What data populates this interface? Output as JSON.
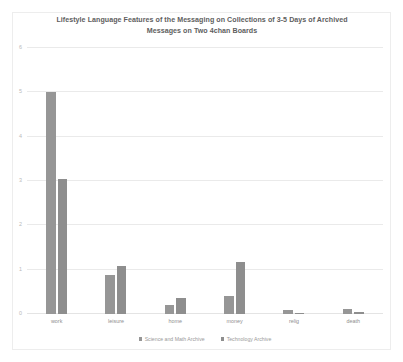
{
  "chart_data": {
    "type": "bar",
    "title": "Lifestyle Language Features of the Messaging on Collections of 3-5 Days of Archived Messages on Two 4chan Boards",
    "title_line_1": "Lifestyle Language Features of the Messaging on Collections of 3-5 Days of Archived",
    "title_line_2": "Messages on Two 4chan Boards",
    "xlabel": "",
    "ylabel": "",
    "categories": [
      "work",
      "leisure",
      "home",
      "money",
      "relig",
      "death"
    ],
    "series": [
      {
        "name": "Science and Math Archive",
        "color": "#969696",
        "values": [
          5.0,
          0.88,
          0.2,
          0.4,
          0.1,
          0.12
        ]
      },
      {
        "name": "Technology Archive",
        "color": "#8e8e8e",
        "values": [
          3.05,
          1.08,
          0.37,
          1.17,
          0.03,
          0.04
        ]
      }
    ],
    "ylim": [
      0,
      6
    ],
    "yticks": [
      0,
      1,
      2,
      3,
      4,
      5,
      6
    ],
    "ytick_labels": [
      "0",
      "1",
      "2",
      "3",
      "4",
      "5",
      "6"
    ],
    "grid": true,
    "legend_position": "bottom"
  }
}
